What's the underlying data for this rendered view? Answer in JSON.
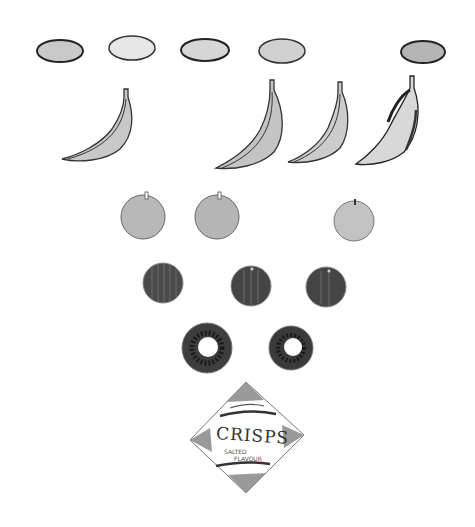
{
  "illustration": {
    "style": "hand-drawn pencil and watercolor, grayscale",
    "rows": [
      {
        "name": "eggs-or-potatoes",
        "count": 5,
        "shape": "oval"
      },
      {
        "name": "bananas",
        "count": 4
      },
      {
        "name": "apples",
        "count": 3
      },
      {
        "name": "plums",
        "count": 3
      },
      {
        "name": "doughnuts",
        "count": 2
      },
      {
        "name": "crisps-packet",
        "count": 1
      }
    ],
    "crisps": {
      "title": "CRISPS",
      "line1": "SALTED",
      "line2": "FLAVOUR"
    }
  }
}
